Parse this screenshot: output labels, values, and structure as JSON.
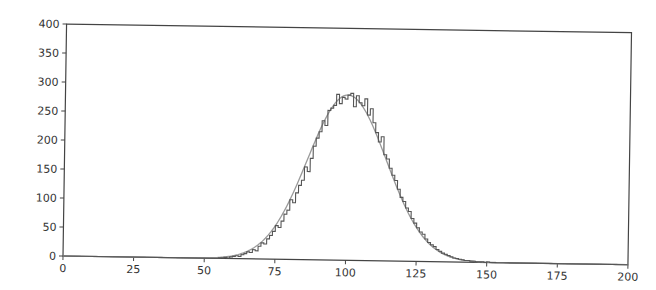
{
  "chart_data": {
    "type": "line",
    "title": "",
    "xlabel": "",
    "ylabel": "",
    "xlim": [
      0,
      200
    ],
    "ylim": [
      0,
      400
    ],
    "grid": false,
    "legend": null,
    "x_ticks": [
      0,
      25,
      50,
      75,
      100,
      125,
      150,
      175,
      200
    ],
    "y_ticks": [
      0,
      50,
      100,
      150,
      200,
      250,
      300,
      350,
      400
    ],
    "series": [
      {
        "name": "histogram (step)",
        "style": "step",
        "color": "#555555",
        "bin_width": 1,
        "x_start": 55,
        "values": [
          1,
          1,
          2,
          1,
          3,
          4,
          5,
          4,
          7,
          9,
          12,
          11,
          16,
          14,
          22,
          28,
          26,
          35,
          41,
          48,
          58,
          55,
          66,
          78,
          85,
          103,
          98,
          115,
          128,
          137,
          160,
          152,
          175,
          196,
          210,
          221,
          240,
          232,
          258,
          262,
          267,
          286,
          270,
          281,
          278,
          285,
          288,
          265,
          284,
          272,
          267,
          279,
          251,
          262,
          238,
          221,
          205,
          214,
          183,
          176,
          160,
          148,
          139,
          124,
          110,
          103,
          92,
          86,
          74,
          66,
          58,
          51,
          47,
          39,
          33,
          29,
          26,
          21,
          18,
          15,
          13,
          11,
          9,
          7,
          6,
          5,
          4,
          3,
          3,
          2,
          2,
          1,
          1,
          1,
          0,
          1,
          0,
          0,
          0,
          0,
          0
        ]
      },
      {
        "name": "normal fit",
        "style": "smooth",
        "color": "#8a8a8a",
        "mean": 100,
        "std": 14,
        "peak": 285
      }
    ]
  }
}
